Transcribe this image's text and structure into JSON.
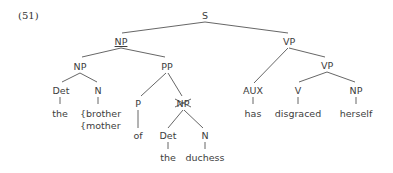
{
  "example_number": "(51)",
  "tree": {
    "root": "S",
    "subject_np": "NP",
    "inner_np": "NP",
    "pp": "PP",
    "det1": "Det",
    "n1": "N",
    "word_the1": "the",
    "word_brother": "{brother",
    "word_mother": "{mother",
    "p": "P",
    "word_of": "of",
    "pp_np_struck": "NP",
    "det2": "Det",
    "n2": "N",
    "word_the2": "the",
    "word_duchess": "duchess",
    "vp_top": "VP",
    "aux": "AUX",
    "word_has": "has",
    "vp_lower": "VP",
    "v": "V",
    "word_disgraced": "disgraced",
    "obj_np": "NP",
    "word_herself": "herself"
  }
}
